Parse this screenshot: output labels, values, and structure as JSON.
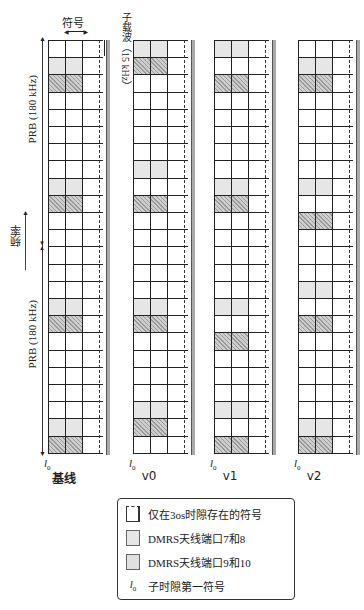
{
  "top_labels": {
    "symbol": "符号",
    "subcarrier": "子载波（15 kHz）"
  },
  "axis": {
    "frequency": "频率",
    "prb_upper": "PRB (180 kHz)",
    "prb_lower": "PRB (180 kHz)"
  },
  "grid": {
    "rows": 24,
    "row_height": 17.2,
    "columns": [
      {
        "label": "基线",
        "l0": "l",
        "l0_sub": "0",
        "light_rows": [
          1,
          8,
          15,
          22
        ],
        "hatched_rows": [
          2,
          9,
          16,
          23
        ]
      },
      {
        "label": "v0",
        "l0": "l",
        "l0_sub": "0",
        "light_rows": [
          0,
          7,
          15,
          21
        ],
        "hatched_rows": [
          1,
          9,
          16,
          22
        ]
      },
      {
        "label": "v1",
        "l0": "l",
        "l0_sub": "0",
        "light_rows": [
          0,
          8,
          15,
          21
        ],
        "hatched_rows": [
          2,
          9,
          17,
          23
        ]
      },
      {
        "label": "v2",
        "l0": "l",
        "l0_sub": "0",
        "light_rows": [
          1,
          8,
          14,
          22
        ],
        "hatched_rows": [
          2,
          10,
          16,
          23
        ]
      }
    ]
  },
  "legend": {
    "items": [
      {
        "swatch": "empty",
        "label": "仅在3os时隙存在的符号"
      },
      {
        "swatch": "light",
        "label": "DMRS天线端口7和8"
      },
      {
        "swatch": "hatch",
        "label": "DMRS天线端口9和10"
      },
      {
        "swatch": "l0",
        "symbol": "l",
        "symbol_sub": "0",
        "label": "子时隙第一符号"
      }
    ]
  },
  "colors": {
    "light_fill": "#e6e6e6",
    "hatch_fill": "#cfcfcf",
    "grid_line": "#222222"
  }
}
